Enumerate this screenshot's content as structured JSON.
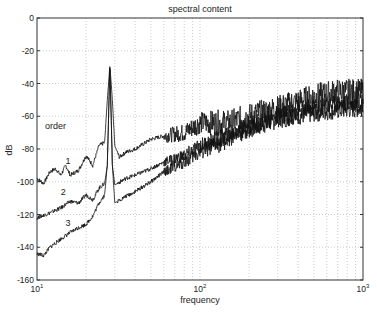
{
  "chart_data": {
    "type": "line",
    "title": "spectral content",
    "xlabel": "frequency",
    "ylabel": "dB",
    "xscale": "log",
    "xlim": [
      10,
      1000
    ],
    "ylim": [
      -160,
      0
    ],
    "grid": true,
    "x_ticks": [
      "10^1",
      "10^2",
      "10^3"
    ],
    "y_ticks": [
      0,
      -20,
      -40,
      -60,
      -80,
      -100,
      -120,
      -140,
      -160
    ],
    "annotations": [
      {
        "text": "order",
        "x": 13,
        "y": -68
      },
      {
        "text": "1",
        "x": 15.5,
        "y": -89
      },
      {
        "text": "2",
        "x": 14.5,
        "y": -108
      },
      {
        "text": "3",
        "x": 15.5,
        "y": -127
      }
    ],
    "series": [
      {
        "name": "order 1",
        "x": [
          10,
          11,
          12,
          13,
          14,
          15,
          16,
          18,
          20,
          22,
          24,
          26,
          27,
          28,
          29,
          30,
          32,
          35,
          40,
          50,
          60,
          80,
          100,
          150,
          200,
          300,
          500,
          700,
          1000
        ],
        "y": [
          -98,
          -101,
          -94,
          -92,
          -96,
          -90,
          -96,
          -93,
          -84,
          -90,
          -78,
          -76,
          -50,
          -29,
          -50,
          -78,
          -85,
          -82,
          -80,
          -74,
          -72,
          -70,
          -64,
          -64,
          -60,
          -55,
          -48,
          -45,
          -45
        ]
      },
      {
        "name": "order 2",
        "x": [
          10,
          12,
          14,
          16,
          18,
          20,
          22,
          24,
          26,
          27,
          28,
          29,
          30,
          35,
          40,
          50,
          60,
          80,
          100,
          150,
          200,
          300,
          500,
          700,
          1000
        ],
        "y": [
          -122,
          -119,
          -116,
          -112,
          -113,
          -108,
          -111,
          -104,
          -101,
          -90,
          -29,
          -90,
          -102,
          -98,
          -96,
          -92,
          -88,
          -84,
          -78,
          -72,
          -66,
          -60,
          -55,
          -52,
          -52
        ]
      },
      {
        "name": "order 3",
        "x": [
          10,
          11,
          12,
          14,
          16,
          18,
          20,
          22,
          24,
          26,
          27,
          28,
          29,
          30,
          35,
          40,
          50,
          60,
          80,
          100,
          150,
          200,
          300,
          500,
          700,
          1000
        ],
        "y": [
          -144,
          -145,
          -140,
          -135,
          -131,
          -128,
          -126,
          -121,
          -113,
          -108,
          -90,
          -29,
          -90,
          -113,
          -109,
          -106,
          -100,
          -94,
          -88,
          -82,
          -74,
          -68,
          -62,
          -58,
          -56,
          -55
        ]
      }
    ]
  }
}
